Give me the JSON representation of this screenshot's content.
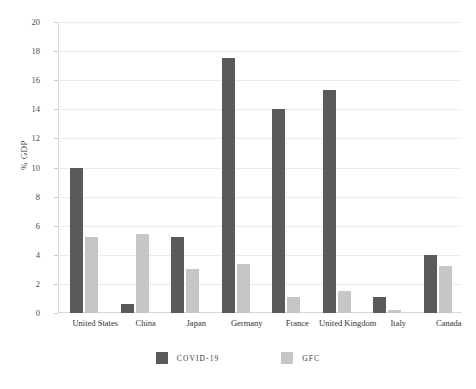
{
  "chart_data": {
    "type": "bar",
    "title": "",
    "xlabel": "",
    "ylabel": "% GDP",
    "ylim": [
      0,
      20
    ],
    "yticks": [
      0,
      2,
      4,
      6,
      8,
      10,
      12,
      14,
      16,
      18,
      20
    ],
    "grid": true,
    "legend_position": "bottom",
    "categories": [
      "United States",
      "China",
      "Japan",
      "Germany",
      "France",
      "United Kingdom",
      "Italy",
      "Canada"
    ],
    "series": [
      {
        "name": "COVID-19",
        "color": "#5a5a5a",
        "values": [
          10.0,
          0.6,
          5.25,
          17.5,
          14.0,
          15.3,
          1.1,
          4.0
        ]
      },
      {
        "name": "GFC",
        "color": "#c6c6c6",
        "values": [
          5.2,
          5.45,
          3.0,
          3.4,
          1.1,
          1.5,
          0.2,
          3.25
        ]
      }
    ]
  },
  "legend": {
    "items": [
      {
        "label": "COVID-19",
        "color": "#5a5a5a"
      },
      {
        "label": "GFC",
        "color": "#c6c6c6"
      }
    ]
  }
}
